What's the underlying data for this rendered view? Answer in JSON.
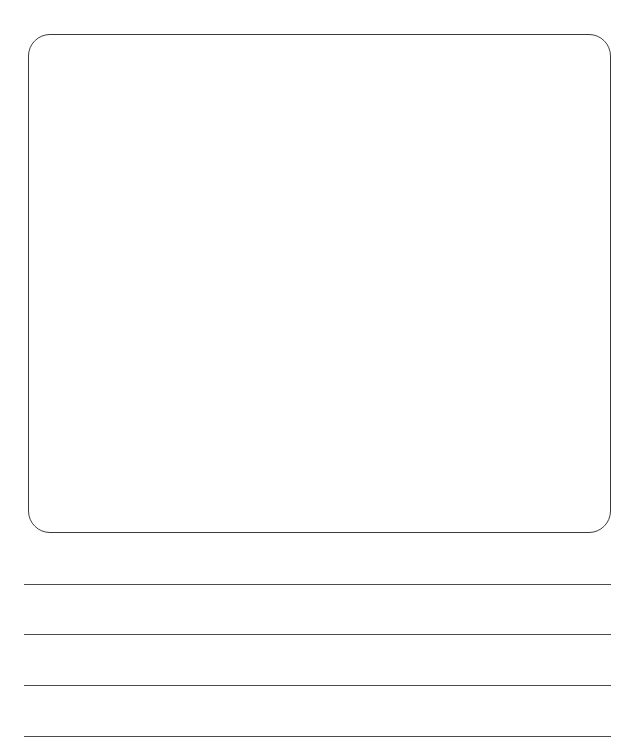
{
  "worksheet": {
    "drawing_area": {
      "label": "",
      "border_color": "#3a3a3a"
    },
    "writing_lines": [
      {
        "index": 1,
        "text": ""
      },
      {
        "index": 2,
        "text": ""
      },
      {
        "index": 3,
        "text": ""
      },
      {
        "index": 4,
        "text": ""
      }
    ],
    "line_color": "#4a4a4a"
  }
}
